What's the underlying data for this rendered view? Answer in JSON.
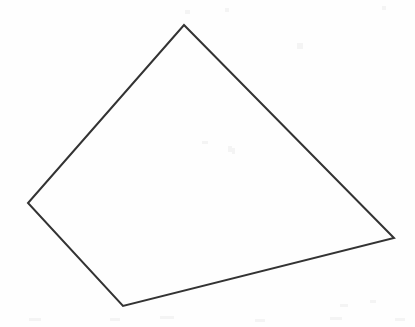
{
  "figure": {
    "width": 415,
    "height": 327,
    "background_color": "#fefefe",
    "stroke_color": "#333333",
    "stroke_width": 2,
    "fill_color": "none"
  },
  "chart_data": {
    "type": "line",
    "shape": "quadrilateral",
    "closed": true,
    "vertices": [
      {
        "name": "top-apex",
        "x": 184,
        "y": 25
      },
      {
        "name": "right",
        "x": 394,
        "y": 238
      },
      {
        "name": "bottom",
        "x": 123,
        "y": 306
      },
      {
        "name": "left",
        "x": 28,
        "y": 203
      }
    ],
    "edges": [
      {
        "name": "top-right-edge",
        "from": "top-apex",
        "to": "right"
      },
      {
        "name": "bottom-right-edge",
        "from": "right",
        "to": "bottom"
      },
      {
        "name": "bottom-left-edge",
        "from": "bottom",
        "to": "left"
      },
      {
        "name": "top-left-edge",
        "from": "left",
        "to": "top-apex"
      }
    ],
    "points_path": "184,25 394,238 123,306 28,203",
    "xlabel": "",
    "ylabel": "",
    "xlim": [
      0,
      415
    ],
    "ylim": [
      0,
      327
    ],
    "grid": false,
    "legend": null
  },
  "artifacts": {
    "specks": [
      {
        "x": 297,
        "y": 43,
        "w": 6,
        "h": 6
      },
      {
        "x": 185,
        "y": 10,
        "w": 5,
        "h": 4
      },
      {
        "x": 225,
        "y": 8,
        "w": 4,
        "h": 4
      },
      {
        "x": 382,
        "y": 6,
        "w": 4,
        "h": 4
      },
      {
        "x": 202,
        "y": 141,
        "w": 6,
        "h": 3
      },
      {
        "x": 228,
        "y": 146,
        "w": 4,
        "h": 6
      },
      {
        "x": 232,
        "y": 148,
        "w": 3,
        "h": 6
      },
      {
        "x": 29,
        "y": 318,
        "w": 12,
        "h": 3
      },
      {
        "x": 110,
        "y": 318,
        "w": 10,
        "h": 3
      },
      {
        "x": 160,
        "y": 316,
        "w": 14,
        "h": 3
      },
      {
        "x": 255,
        "y": 319,
        "w": 10,
        "h": 3
      },
      {
        "x": 330,
        "y": 317,
        "w": 12,
        "h": 3
      },
      {
        "x": 395,
        "y": 318,
        "w": 10,
        "h": 3
      },
      {
        "x": 340,
        "y": 304,
        "w": 8,
        "h": 3
      },
      {
        "x": 370,
        "y": 300,
        "w": 6,
        "h": 3
      }
    ]
  }
}
